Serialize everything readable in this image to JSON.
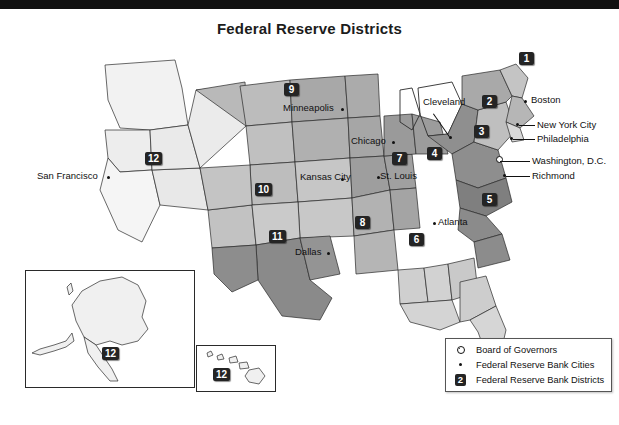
{
  "page": {
    "title": "Federal Reserve Districts",
    "top_bar_color": "#111111",
    "background_color": "#ffffff"
  },
  "map": {
    "type": "choropleth-district-map",
    "region": "United States",
    "districts": [
      {
        "number": "1",
        "bank_city": "Boston",
        "x": 524,
        "y": 55
      },
      {
        "number": "2",
        "bank_city": "New York City",
        "x": 487,
        "y": 98
      },
      {
        "number": "3",
        "bank_city": "Philadelphia",
        "x": 479,
        "y": 128
      },
      {
        "number": "4",
        "bank_city": "Cleveland",
        "x": 432,
        "y": 150
      },
      {
        "number": "5",
        "bank_city": "Richmond",
        "x": 487,
        "y": 196
      },
      {
        "number": "6",
        "bank_city": "Atlanta",
        "x": 414,
        "y": 236
      },
      {
        "number": "7",
        "bank_city": "Chicago",
        "x": 397,
        "y": 155
      },
      {
        "number": "8",
        "bank_city": "St. Louis",
        "x": 360,
        "y": 219
      },
      {
        "number": "9",
        "bank_city": "Minneapolis",
        "x": 289,
        "y": 86
      },
      {
        "number": "10",
        "bank_city": "Kansas City",
        "x": 262,
        "y": 186
      },
      {
        "number": "11",
        "bank_city": "Dallas",
        "x": 276,
        "y": 233
      },
      {
        "number": "12",
        "bank_city": "San Francisco",
        "x": 152,
        "y": 155
      }
    ],
    "city_labels": [
      {
        "name": "Boston",
        "label_x": 531,
        "label_y": 96,
        "dot_x": 524,
        "dot_y": 100,
        "align": "left",
        "leader": false
      },
      {
        "name": "New York City",
        "label_x": 537,
        "label_y": 126,
        "dot_x": 516,
        "dot_y": 123,
        "align": "left",
        "leader": true
      },
      {
        "name": "Philadelphia",
        "label_x": 537,
        "label_y": 139,
        "dot_x": 510,
        "dot_y": 137,
        "align": "left",
        "leader": true
      },
      {
        "name": "Washington, D.C.",
        "label_x": 532,
        "label_y": 163,
        "dot_x": 505,
        "dot_y": 161,
        "align": "left",
        "leader": true
      },
      {
        "name": "Richmond",
        "label_x": 532,
        "label_y": 176,
        "dot_x": 503,
        "dot_y": 174,
        "align": "left",
        "leader": true
      },
      {
        "name": "Cleveland",
        "label_x": 425,
        "label_y": 100,
        "dot_x": 449,
        "dot_y": 136,
        "align": "left",
        "leader": true
      },
      {
        "name": "Atlanta",
        "label_x": 437,
        "label_y": 224,
        "dot_x": 433,
        "dot_y": 222,
        "align": "left",
        "leader": false
      },
      {
        "name": "Chicago",
        "label_x": 352,
        "label_y": 140,
        "dot_x": 392,
        "dot_y": 141,
        "align": "left",
        "leader": false
      },
      {
        "name": "St. Louis",
        "label_x": 378,
        "label_y": 172,
        "dot_x": 377,
        "dot_y": 176,
        "align": "left",
        "leader": false
      },
      {
        "name": "Minneapolis",
        "label_x": 285,
        "label_y": 105,
        "dot_x": 341,
        "dot_y": 108,
        "align": "left",
        "leader": false
      },
      {
        "name": "Kansas City",
        "label_x": 303,
        "label_y": 176,
        "dot_x": 341,
        "dot_y": 178,
        "align": "left",
        "leader": false
      },
      {
        "name": "Dallas",
        "label_x": 296,
        "label_y": 248,
        "dot_x": 327,
        "dot_y": 252,
        "align": "left",
        "leader": false
      },
      {
        "name": "San Francisco",
        "label_x": 38,
        "label_y": 175,
        "dot_x": 107,
        "dot_y": 176,
        "align": "left",
        "leader": false
      }
    ],
    "board_of_governors": {
      "label": "Washington, D.C.",
      "x": 497,
      "y": 157
    },
    "insets": [
      {
        "name": "alaska-inset",
        "district": "12",
        "x": 25,
        "y": 270,
        "width": 168,
        "height": 116
      },
      {
        "name": "hawaii-inset",
        "district": "12",
        "x": 196,
        "y": 345,
        "width": 78,
        "height": 45
      }
    ]
  },
  "legend": {
    "items": [
      {
        "symbol": "board-of-governors-symbol",
        "label": "Board of Governors"
      },
      {
        "symbol": "bank-city-dot-symbol",
        "label": "Federal Reserve Bank Cities"
      },
      {
        "symbol": "district-badge-symbol",
        "label": "Federal Reserve Bank Districts",
        "badge": "2"
      }
    ]
  }
}
